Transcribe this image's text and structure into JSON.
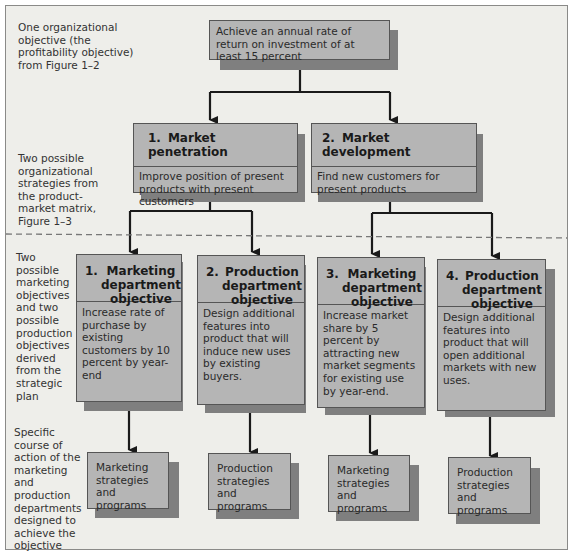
{
  "annotations": {
    "level1": "One organizational objective (the profitability objective) from Figure 1–2",
    "level2": "Two possible organizational strategies from the product-market matrix, Figure 1–3",
    "level3": "Two possible marketing objectives and two possible production objectives derived from the strategic plan",
    "level4": "Specific course of action of the marketing and production departments designed to achieve the objective"
  },
  "top": {
    "text": "Achieve an annual rate of return on investment of at least 15 percent"
  },
  "strategies": [
    {
      "num": "1.",
      "title": "Market penetration",
      "desc": "Improve position of present products with present customers"
    },
    {
      "num": "2.",
      "title": "Market development",
      "desc": "Find new customers for present products"
    }
  ],
  "objectives": [
    {
      "num": "1.",
      "title": "Marketing department objective",
      "desc": "Increase rate of purchase by existing customers by 10 percent by year-end"
    },
    {
      "num": "2.",
      "title": "Production department objective",
      "desc": "Design additional features into product that will induce new uses by existing buyers."
    },
    {
      "num": "3.",
      "title": "Marketing department objective",
      "desc": "Increase market share by 5 percent by attracting new market segments for existing use by year-end."
    },
    {
      "num": "4.",
      "title": "Production department objective",
      "desc": "Design additional features into product that will open additional markets with new uses."
    }
  ],
  "programs": [
    {
      "text": "Marketing strategies and programs"
    },
    {
      "text": "Production strategies and programs"
    },
    {
      "text": "Marketing strategies and programs"
    },
    {
      "text": "Production strategies and programs"
    }
  ],
  "colors": {
    "background": "#eeeeea",
    "box_fill": "#b5b5b5",
    "shadow": "#7f7f7f",
    "line": "#1a1a1a",
    "divider": "#777777"
  }
}
